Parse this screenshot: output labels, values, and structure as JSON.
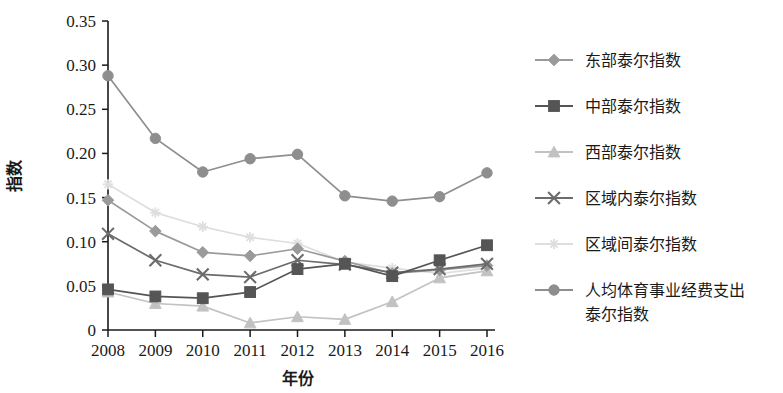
{
  "chart_data": {
    "type": "line",
    "title": "",
    "xlabel": "年份",
    "ylabel": "指数",
    "categories": [
      "2008",
      "2009",
      "2010",
      "2011",
      "2012",
      "2013",
      "2014",
      "2015",
      "2016"
    ],
    "x_tick_labels": [
      "2008",
      "2009",
      "2010",
      "2011",
      "2012",
      "2013",
      "2014",
      "2015",
      "2016"
    ],
    "y_tick_labels": [
      "0.35",
      "0.30",
      "0.25",
      "0.20",
      "0.15",
      "0.10",
      "0.05",
      "0"
    ],
    "y_tick_values": [
      0.35,
      0.3,
      0.25,
      0.2,
      0.15,
      0.1,
      0.05,
      0
    ],
    "ylim": [
      0,
      0.35
    ],
    "xlim": [
      2008,
      2016
    ],
    "grid": false,
    "legend_position": "right",
    "series": [
      {
        "name": "东部泰尔指数",
        "marker": "diamond",
        "color": "#9a9a9a",
        "line_style": "solid",
        "values": [
          0.147,
          0.112,
          0.088,
          0.084,
          0.092,
          0.078,
          0.064,
          0.068,
          0.073
        ]
      },
      {
        "name": "中部泰尔指数",
        "marker": "square",
        "color": "#555555",
        "line_style": "solid",
        "values": [
          0.046,
          0.038,
          0.036,
          0.043,
          0.069,
          0.075,
          0.061,
          0.079,
          0.096
        ]
      },
      {
        "name": "西部泰尔指数",
        "marker": "triangle",
        "color": "#c2c2c2",
        "line_style": "solid",
        "values": [
          0.043,
          0.03,
          0.027,
          0.008,
          0.015,
          0.012,
          0.032,
          0.059,
          0.067
        ]
      },
      {
        "name": "区域内泰尔指数",
        "marker": "x",
        "color": "#6b6b6b",
        "line_style": "solid",
        "values": [
          0.109,
          0.079,
          0.063,
          0.06,
          0.079,
          0.074,
          0.065,
          0.069,
          0.075
        ]
      },
      {
        "name": "区域间泰尔指数",
        "marker": "star",
        "color": "#dedede",
        "line_style": "solid",
        "values": [
          0.165,
          0.133,
          0.117,
          0.105,
          0.098,
          0.077,
          0.07,
          0.064,
          0.07
        ]
      },
      {
        "name": "人均体育事业经费支出泰尔指数",
        "marker": "circle",
        "color": "#8e8e8e",
        "line_style": "solid",
        "values": [
          0.288,
          0.217,
          0.179,
          0.194,
          0.199,
          0.152,
          0.146,
          0.151,
          0.178
        ]
      }
    ]
  },
  "legend": {
    "items": [
      {
        "label": "东部泰尔指数",
        "label_line2": ""
      },
      {
        "label": "中部泰尔指数",
        "label_line2": ""
      },
      {
        "label": "西部泰尔指数",
        "label_line2": ""
      },
      {
        "label": "区域内泰尔指数",
        "label_line2": ""
      },
      {
        "label": "区域间泰尔指数",
        "label_line2": ""
      },
      {
        "label": "人均体育事业经费支出",
        "label_line2": "泰尔指数"
      }
    ]
  },
  "axes": {
    "y_label": "指数",
    "x_label": "年份"
  }
}
